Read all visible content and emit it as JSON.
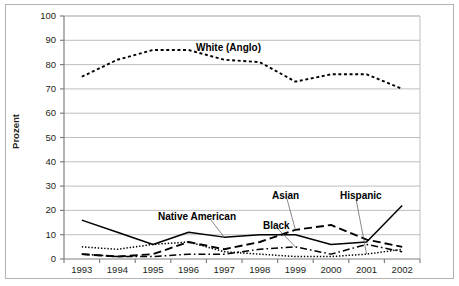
{
  "chart_data": {
    "type": "line",
    "title": "",
    "xlabel": "",
    "ylabel": "Prozent",
    "categories": [
      "1993",
      "1994",
      "1995",
      "1996",
      "1997",
      "1998",
      "1999",
      "2000",
      "2001",
      "2002"
    ],
    "x": [
      1993,
      1994,
      1995,
      1996,
      1997,
      1998,
      1999,
      2000,
      2001,
      2002
    ],
    "ylim": [
      0,
      100
    ],
    "yticks": [
      0,
      10,
      20,
      30,
      40,
      50,
      60,
      70,
      80,
      90,
      100
    ],
    "grid": true,
    "legend_position": "inline-annotations",
    "series": [
      {
        "name": "White (Anglo)",
        "style": "dotted",
        "values": [
          75,
          82,
          86,
          86,
          82,
          81,
          73,
          76,
          76,
          70
        ]
      },
      {
        "name": "Native American",
        "style": "solid",
        "values": [
          16,
          11,
          6,
          11,
          9,
          10,
          10,
          6,
          7,
          22
        ]
      },
      {
        "name": "Black",
        "style": "dashdot",
        "values": [
          2,
          1,
          1,
          2,
          2,
          4,
          5,
          2,
          6,
          3
        ]
      },
      {
        "name": "Asian",
        "style": "dashed",
        "values": [
          2,
          1,
          2,
          7,
          4,
          7,
          12,
          14,
          8,
          5
        ]
      },
      {
        "name": "Hispanic",
        "style": "finedotted",
        "values": [
          5,
          4,
          6,
          7,
          3,
          2,
          1,
          1,
          2,
          4
        ]
      }
    ],
    "annotations": [
      {
        "text": "White (Anglo)",
        "target_year": 1997,
        "target_value": 82
      },
      {
        "text": "Native American",
        "target_year": 1997,
        "target_value": 9
      },
      {
        "text": "Black",
        "target_year": 1999,
        "target_value": 5
      },
      {
        "text": "Asian",
        "target_year": 1999,
        "target_value": 12
      },
      {
        "text": "Hispanic",
        "target_year": 2001,
        "target_value": 2
      }
    ],
    "colors": {
      "line": "#000000",
      "grid": "#bfbfbf",
      "axis": "#808080",
      "text": "#231f20",
      "background": "#ffffff",
      "border": "#b3b3b3"
    }
  }
}
